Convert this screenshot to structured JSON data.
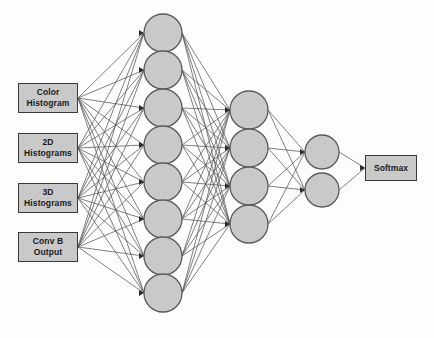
{
  "diagram": {
    "background_color": "#fdfdfd",
    "node_fill": "#c9c9c9",
    "node_stroke": "#5a5a5a",
    "edge_color": "#555555",
    "box_fill": "#c9c9c9",
    "box_stroke": "#3a3a3a"
  },
  "inputs": [
    {
      "id": "color-histogram",
      "line1": "Color",
      "line2": "Histogram",
      "x": 18,
      "y": 83,
      "w": 60,
      "h": 30
    },
    {
      "id": "2d-histograms",
      "line1": "2D",
      "line2": "Histograms",
      "x": 18,
      "y": 133,
      "w": 60,
      "h": 30
    },
    {
      "id": "3d-histograms",
      "line1": "3D",
      "line2": "Histograms",
      "x": 18,
      "y": 183,
      "w": 60,
      "h": 30
    },
    {
      "id": "conv-b-output",
      "line1": "Conv B",
      "line2": "Output",
      "x": 18,
      "y": 232,
      "w": 60,
      "h": 30
    }
  ],
  "output": {
    "id": "softmax",
    "label": "Softmax",
    "x": 365,
    "y": 155,
    "w": 52,
    "h": 26
  },
  "layers": [
    {
      "name": "hidden-layer-1",
      "count": 8,
      "cx": 163,
      "r": 19,
      "cys": [
        33,
        70,
        108,
        145,
        182,
        219,
        256,
        293
      ]
    },
    {
      "name": "hidden-layer-2",
      "count": 4,
      "cx": 249,
      "r": 19,
      "cys": [
        110,
        148,
        186,
        224
      ]
    },
    {
      "name": "hidden-layer-3",
      "count": 2,
      "cx": 322,
      "r": 17,
      "cys": [
        152,
        190
      ]
    }
  ],
  "connections": {
    "inputs_to_layer1": "fully-connected",
    "layer1_to_layer2": "fully-connected",
    "layer2_to_layer3": "fully-connected",
    "layer3_to_output": "fully-connected"
  }
}
